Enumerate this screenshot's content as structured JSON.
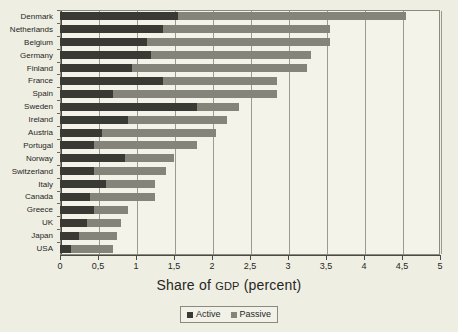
{
  "chart_data": {
    "type": "bar",
    "orientation": "horizontal",
    "stacked": true,
    "title": "",
    "xlabel": "Share of GDP (percent)",
    "ylabel": "",
    "xlim": [
      0,
      5
    ],
    "grid": true,
    "legend_position": "bottom",
    "xtick_labels": [
      "0",
      "0,5",
      "1",
      "1,5",
      "2",
      "2,5",
      "3",
      "3,5",
      "4",
      "4,5",
      "5"
    ],
    "xtick_values": [
      0,
      0.5,
      1,
      1.5,
      2,
      2.5,
      3,
      3.5,
      4,
      4.5,
      5
    ],
    "categories": [
      "Denmark",
      "Netherlands",
      "Belgium",
      "Germany",
      "Finland",
      "France",
      "Spain",
      "Sweden",
      "Ireland",
      "Austria",
      "Portugal",
      "Norway",
      "Switzerland",
      "Italy",
      "Canada",
      "Greece",
      "UK",
      "Japan",
      "USA"
    ],
    "series": [
      {
        "name": "Active",
        "color": "#3a3a34",
        "values": [
          1.55,
          1.35,
          1.15,
          1.2,
          0.95,
          1.35,
          0.7,
          1.8,
          0.9,
          0.55,
          0.45,
          0.85,
          0.45,
          0.6,
          0.4,
          0.45,
          0.35,
          0.25,
          0.15
        ]
      },
      {
        "name": "Passive",
        "color": "#84847a",
        "values": [
          3.0,
          2.2,
          2.4,
          2.1,
          2.3,
          1.5,
          2.15,
          0.55,
          1.3,
          1.5,
          1.35,
          0.65,
          0.95,
          0.65,
          0.85,
          0.45,
          0.45,
          0.5,
          0.55
        ]
      }
    ],
    "totals": [
      4.55,
      3.55,
      3.55,
      3.3,
      3.25,
      2.85,
      2.85,
      2.35,
      2.2,
      2.05,
      1.8,
      1.5,
      1.4,
      1.25,
      1.25,
      0.9,
      0.8,
      0.75,
      0.7
    ]
  },
  "legend": {
    "entries": [
      {
        "label": "Active",
        "swatch": "active-swatch-icon"
      },
      {
        "label": "Passive",
        "swatch": "passive-swatch-icon"
      }
    ]
  },
  "axis_title": {
    "before": "Share of ",
    "smallcaps": "GDP",
    "after": " (percent)"
  },
  "colors": {
    "background": "#efeee3",
    "plot_background": "#f4f3ea",
    "active": "#3a3a34",
    "passive": "#84847a",
    "axis": "#4a4a44",
    "grid": "#9a9a90"
  }
}
